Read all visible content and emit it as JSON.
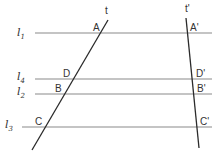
{
  "diagram": {
    "colors": {
      "background": "#ffffff",
      "parallel_lines": "#8a8a8a",
      "transversals": "#2a2a2a",
      "text": "#333333"
    },
    "parallel_lines": [
      {
        "id": "l1",
        "name": "l",
        "sub": "1",
        "y": 33,
        "x1": 35,
        "x2": 212
      },
      {
        "id": "l4",
        "name": "l",
        "sub": "4",
        "y": 79,
        "x1": 35,
        "x2": 212
      },
      {
        "id": "l2",
        "name": "l",
        "sub": "2",
        "y": 94,
        "x1": 35,
        "x2": 212
      },
      {
        "id": "l3",
        "name": "l",
        "sub": "3",
        "y": 127,
        "x1": 22,
        "x2": 212
      }
    ],
    "transversals": [
      {
        "id": "t",
        "label": "t",
        "x1": 32,
        "y1": 150,
        "x2": 108,
        "y2": 20
      },
      {
        "id": "t_prime",
        "label": "t'",
        "x1": 186,
        "y1": 18,
        "x2": 199,
        "y2": 148
      }
    ],
    "points": [
      {
        "label": "A",
        "x": 93,
        "y": 31
      },
      {
        "label": "D",
        "x": 66,
        "y": 77
      },
      {
        "label": "B",
        "x": 57,
        "y": 92
      },
      {
        "label": "C",
        "x": 37,
        "y": 125
      },
      {
        "label": "A'",
        "x": 191,
        "y": 31
      },
      {
        "label": "D'",
        "x": 197,
        "y": 77
      },
      {
        "label": "B'",
        "x": 198,
        "y": 92
      },
      {
        "label": "C'",
        "x": 201,
        "y": 125
      }
    ]
  }
}
